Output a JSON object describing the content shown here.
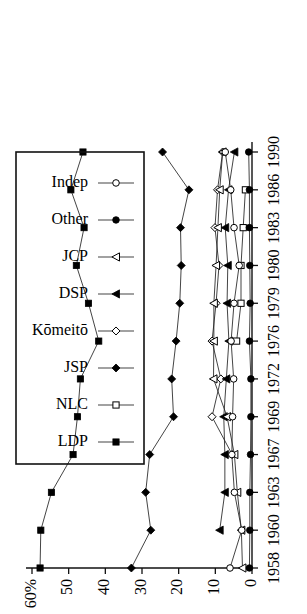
{
  "chart_data": {
    "type": "line",
    "title": "",
    "subtitle": "",
    "xlabel": "",
    "ylabel": "",
    "orientation": "rotated-90-ccw",
    "grid": false,
    "legend_position": "top-right",
    "x": [
      1958,
      1960,
      1963,
      1967,
      1969,
      1972,
      1976,
      1979,
      1980,
      1983,
      1986,
      1990
    ],
    "xtick_labels": [
      "1958",
      "1960",
      "1963",
      "1967",
      "1969",
      "1972",
      "1976",
      "1979",
      "1980",
      "1983",
      "1986",
      "1990"
    ],
    "ytick_labels": [
      "60%",
      "50",
      "40",
      "30",
      "20",
      "10",
      "0"
    ],
    "ytick_values": [
      60,
      50,
      40,
      30,
      20,
      10,
      0
    ],
    "ylim": [
      0,
      60
    ],
    "y_unit": "%",
    "series": [
      {
        "name": "LDP",
        "marker": "filled-square",
        "values": [
          57.8,
          57.6,
          54.7,
          48.8,
          47.6,
          46.8,
          41.8,
          44.6,
          47.9,
          45.8,
          49.4,
          46.1
        ]
      },
      {
        "name": "NLC",
        "marker": "open-square",
        "values": [
          null,
          null,
          null,
          null,
          null,
          null,
          4.2,
          3.0,
          3.0,
          2.4,
          1.8,
          null
        ]
      },
      {
        "name": "JSP",
        "marker": "filled-diamond",
        "values": [
          32.9,
          27.6,
          29.0,
          27.9,
          21.4,
          21.9,
          20.7,
          19.7,
          19.3,
          19.5,
          17.2,
          24.4
        ]
      },
      {
        "name": "Kōmeitō",
        "marker": "open-diamond",
        "values": [
          null,
          null,
          null,
          5.4,
          10.9,
          8.5,
          10.9,
          9.8,
          9.0,
          10.1,
          9.4,
          8.0
        ]
      },
      {
        "name": "DSP",
        "marker": "filled-triangle",
        "values": [
          null,
          8.8,
          7.4,
          7.4,
          7.7,
          7.0,
          6.3,
          6.8,
          6.6,
          7.3,
          6.4,
          4.8
        ]
      },
      {
        "name": "JCP",
        "marker": "open-triangle",
        "values": [
          2.6,
          2.9,
          4.0,
          4.8,
          6.8,
          10.5,
          10.4,
          10.4,
          9.8,
          9.3,
          8.8,
          8.0
        ]
      },
      {
        "name": "Other",
        "marker": "filled-circle",
        "values": [
          0.7,
          0.6,
          0.6,
          0.4,
          0.3,
          0.3,
          0.7,
          0.5,
          0.6,
          0.7,
          0.7,
          0.9
        ]
      },
      {
        "name": "Indep",
        "marker": "open-circle",
        "values": [
          6.0,
          2.8,
          4.8,
          5.5,
          5.3,
          5.0,
          5.7,
          4.9,
          3.5,
          4.9,
          5.8,
          7.3
        ]
      }
    ]
  },
  "legend": {
    "entries": [
      {
        "label": "LDP",
        "marker": "filled-square"
      },
      {
        "label": "NLC",
        "marker": "open-square"
      },
      {
        "label": "JSP",
        "marker": "filled-diamond"
      },
      {
        "label": "Kōmeitō",
        "marker": "open-diamond"
      },
      {
        "label": "DSP",
        "marker": "filled-triangle"
      },
      {
        "label": "JCP",
        "marker": "open-triangle"
      },
      {
        "label": "Other",
        "marker": "filled-circle"
      },
      {
        "label": "Indep",
        "marker": "open-circle"
      }
    ]
  },
  "colors": {
    "ink": "#000000",
    "background": "#ffffff",
    "line": "#222222"
  }
}
